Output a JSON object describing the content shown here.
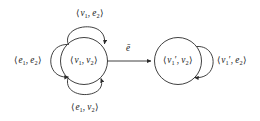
{
  "figure": {
    "type": "state-transition-diagram",
    "background_color": "#ffffff",
    "stroke_color": "#2b2b2b",
    "text_color": "#1a1a1a",
    "width": 260,
    "height": 121
  },
  "nodes": [
    {
      "id": "node-v1v2",
      "label": "⟨v₁, v₂⟩",
      "label_parts": {
        "open": "⟨",
        "first": "v",
        "first_sub": "1",
        "sep": ", ",
        "second": "v",
        "second_sub": "2",
        "close": "⟩"
      },
      "cx": 84,
      "cy": 61,
      "r": 23.5
    },
    {
      "id": "node-v1primev2",
      "label": "⟨v₁′, v₂⟩",
      "label_parts": {
        "open": "⟨",
        "first": "v",
        "first_sub": "1",
        "first_prime": "′",
        "sep": ", ",
        "second": "v",
        "second_sub": "2",
        "close": "⟩"
      },
      "cx": 178,
      "cy": 61,
      "r": 23.5
    }
  ],
  "edges": [
    {
      "id": "edge-top-loop",
      "from": "node-v1v2",
      "to": "node-v1v2",
      "kind": "self-loop",
      "side": "top",
      "label": "⟨v₁, e₂⟩",
      "arrowhead": "upper-right"
    },
    {
      "id": "edge-left-loop",
      "from": "node-v1v2",
      "to": "node-v1v2",
      "kind": "self-loop",
      "side": "left",
      "label": "⟨e₁, e₂⟩",
      "arrowhead": "lower-left"
    },
    {
      "id": "edge-bottom-loop",
      "from": "node-v1v2",
      "to": "node-v1v2",
      "kind": "self-loop",
      "side": "bottom",
      "label": "⟨e₁, v₂⟩",
      "arrowhead": "lower-right"
    },
    {
      "id": "edge-transition",
      "from": "node-v1v2",
      "to": "node-v1primev2",
      "kind": "straight",
      "label": "ē",
      "arrowhead": "right"
    },
    {
      "id": "edge-right-loop",
      "from": "node-v1primev2",
      "to": "node-v1primev2",
      "kind": "self-loop",
      "side": "right",
      "label": "⟨v₁′, e₂⟩",
      "arrowhead": "lower-right"
    }
  ],
  "labels": {
    "top_loop": {
      "open": "⟨",
      "first": "v",
      "first_sub": "1",
      "sep": ", ",
      "second": "e",
      "second_sub": "2",
      "close": "⟩"
    },
    "left_loop": {
      "open": "⟨",
      "first": "e",
      "first_sub": "1",
      "sep": ", ",
      "second": "e",
      "second_sub": "2",
      "close": "⟩"
    },
    "bottom_loop": {
      "open": "⟨",
      "first": "e",
      "first_sub": "1",
      "sep": ", ",
      "second": "v",
      "second_sub": "2",
      "close": "⟩"
    },
    "right_loop": {
      "open": "⟨",
      "first": "v",
      "first_sub": "1",
      "first_prime": "′",
      "sep": ", ",
      "second": "e",
      "second_sub": "2",
      "close": "⟩"
    },
    "transition": "ē",
    "node_left": {
      "open": "⟨",
      "first": "v",
      "first_sub": "1",
      "sep": ", ",
      "second": "v",
      "second_sub": "2",
      "close": "⟩"
    },
    "node_right": {
      "open": "⟨",
      "first": "v",
      "first_sub": "1",
      "first_prime": "′",
      "sep": ", ",
      "second": "v",
      "second_sub": "2",
      "close": "⟩"
    }
  }
}
